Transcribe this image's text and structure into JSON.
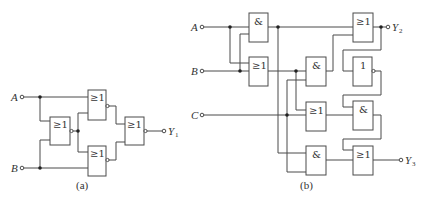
{
  "diagram_a": {
    "caption": "(a)",
    "inputs": [
      {
        "name": "A"
      },
      {
        "name": "B"
      }
    ],
    "output": {
      "name": "Y",
      "sub": "1"
    },
    "gates": [
      {
        "id": "a_g1",
        "symbol": "≥1",
        "negated": true
      },
      {
        "id": "a_g2",
        "symbol": "≥1",
        "negated": true
      },
      {
        "id": "a_g3",
        "symbol": "≥1",
        "negated": true
      },
      {
        "id": "a_g4",
        "symbol": "≥1",
        "negated": true
      }
    ]
  },
  "diagram_b": {
    "caption": "(b)",
    "inputs": [
      {
        "name": "A"
      },
      {
        "name": "B"
      },
      {
        "name": "C"
      }
    ],
    "outputs": [
      {
        "name": "Y",
        "sub": "2"
      },
      {
        "name": "Y",
        "sub": "3"
      }
    ],
    "gates": [
      {
        "id": "b_and1",
        "symbol": "&"
      },
      {
        "id": "b_or1",
        "symbol": "≥1"
      },
      {
        "id": "b_and2",
        "symbol": "&"
      },
      {
        "id": "b_or2",
        "symbol": "≥1"
      },
      {
        "id": "b_and3",
        "symbol": "&"
      },
      {
        "id": "b_or_out2",
        "symbol": "≥1"
      },
      {
        "id": "b_not",
        "symbol": "1",
        "negated": true
      },
      {
        "id": "b_and4",
        "symbol": "&"
      },
      {
        "id": "b_or_out3",
        "symbol": "≥1"
      }
    ]
  }
}
